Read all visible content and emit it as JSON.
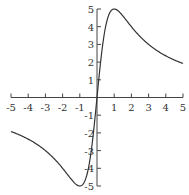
{
  "chart_data": {
    "type": "line",
    "title": "",
    "xlabel": "",
    "ylabel": "",
    "function": "y = 10x / (1 + x^2)",
    "xlim": [
      -5,
      5
    ],
    "ylim": [
      -5,
      5
    ],
    "grid": false,
    "legend": null,
    "x_ticks": [
      -5,
      -4,
      -3,
      -2,
      -1,
      1,
      2,
      3,
      4,
      5
    ],
    "y_ticks": [
      -5,
      -4,
      -3,
      -2,
      -1,
      1,
      2,
      3,
      4,
      5
    ],
    "series": [
      {
        "name": "f(x)",
        "x": [
          -5,
          -4,
          -3,
          -2,
          -1.5,
          -1,
          -0.5,
          0,
          0.5,
          1,
          1.5,
          2,
          3,
          4,
          5
        ],
        "y": [
          -1.92,
          -2.35,
          -3.0,
          -4.0,
          -4.62,
          -5.0,
          -4.0,
          0,
          4.0,
          5.0,
          4.62,
          4.0,
          3.0,
          2.35,
          1.92
        ]
      }
    ],
    "color": "#333333"
  }
}
